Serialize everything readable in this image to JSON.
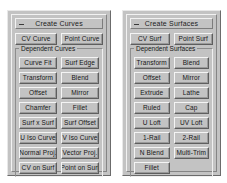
{
  "palettes": [
    {
      "id": "create-curves",
      "title": "Create Curves",
      "minimize_icon": "minimize-icon",
      "top_rows": [
        [
          "CV Curve",
          "Point Curve"
        ]
      ],
      "group": {
        "legend": "Dependent Curves",
        "rows": [
          [
            "Curve Fit",
            "Surf Edge"
          ],
          [
            "Transform",
            "Blend"
          ],
          [
            "Offset",
            "Mirror"
          ],
          [
            "Chamfer",
            "Fillet"
          ],
          [
            "Surf x Surf",
            "Surf Offset"
          ],
          [
            "U Iso Curve",
            "V Iso Curve"
          ],
          [
            "Normal Proj.",
            "Vector Proj."
          ],
          [
            "CV on Surf",
            "Point on Surf"
          ]
        ]
      }
    },
    {
      "id": "create-surfaces",
      "title": "Create Surfaces",
      "minimize_icon": "minimize-icon",
      "top_rows": [
        [
          "CV Surf",
          "Point Surf"
        ]
      ],
      "group": {
        "legend": "Dependent Surfaces",
        "rows": [
          [
            "Transform",
            "Blend"
          ],
          [
            "Offset",
            "Mirror"
          ],
          [
            "Extrude",
            "Lathe"
          ],
          [
            "Ruled",
            "Cap"
          ],
          [
            "U Loft",
            "UV Loft"
          ],
          [
            "1-Rail",
            "2-Rail"
          ],
          [
            "N Blend",
            "Multi-Trim"
          ],
          [
            "Fillet"
          ]
        ]
      }
    }
  ],
  "colors": {
    "panel_face": "#c3c3c3",
    "bevel_light": "#f4f4f4",
    "bevel_dark": "#5e5e5e",
    "text": "#161616",
    "background": "#ffffff"
  }
}
